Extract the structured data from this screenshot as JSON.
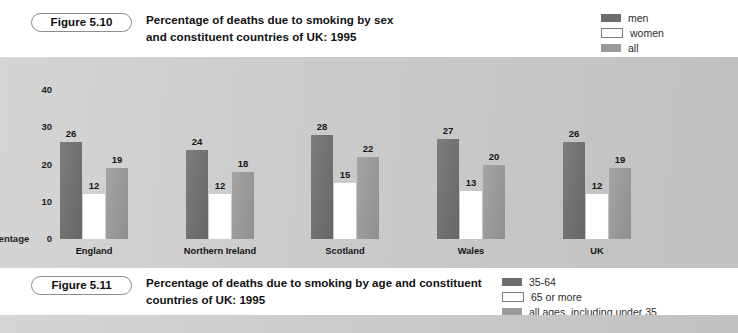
{
  "figure_510": {
    "pill_label": "Figure 5.10",
    "title_line1": "Percentage of deaths due to smoking by sex",
    "title_line2": "and constituent countries of UK: 1995",
    "legend": [
      {
        "label": "men",
        "color": "#6e6e6e"
      },
      {
        "label": "women",
        "color": "#ffffff"
      },
      {
        "label": "all",
        "color": "#9a9a9a"
      }
    ]
  },
  "figure_511": {
    "pill_label": "Figure 5.11",
    "title_line1": "Percentage of deaths due to smoking by age",
    "title_line2": "and constituent countries of UK: 1995",
    "legend": [
      {
        "label": "35-64",
        "color": "#6e6e6e"
      },
      {
        "label": "65 or more",
        "color": "#ffffff"
      },
      {
        "label": "all ages, including under 35",
        "color": "#9a9a9a"
      }
    ]
  },
  "chart_data": {
    "type": "bar",
    "title": "Percentage of deaths due to smoking by sex and constituent countries of UK: 1995",
    "xlabel": "",
    "ylabel": "Percentage",
    "ylim": [
      0,
      45
    ],
    "yticks": [
      0,
      10,
      20,
      30,
      40
    ],
    "grid": false,
    "legend_position": "top-right",
    "categories": [
      "England",
      "Northern Ireland",
      "Scotland",
      "Wales",
      "UK"
    ],
    "series": [
      {
        "name": "men",
        "color": "#6e6e6e",
        "values": [
          26,
          24,
          28,
          27,
          26
        ]
      },
      {
        "name": "women",
        "color": "#ffffff",
        "values": [
          12,
          12,
          15,
          13,
          12
        ]
      },
      {
        "name": "all",
        "color": "#9a9a9a",
        "values": [
          19,
          18,
          22,
          20,
          19
        ]
      }
    ],
    "plot_background": "#c9c9c9"
  }
}
